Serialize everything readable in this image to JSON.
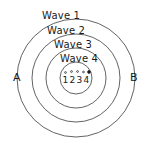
{
  "diagram": {
    "background_color": "#ffffff",
    "stroke_color": "#3b3b3b",
    "text_color": "#1a1a1a",
    "wave_labels": [
      {
        "id": "wave-1",
        "text": "Wave 1"
      },
      {
        "id": "wave-2",
        "text": "Wave 2"
      },
      {
        "id": "wave-3",
        "text": "Wave 3"
      },
      {
        "id": "wave-4",
        "text": "Wave 4"
      }
    ],
    "point_labels": [
      {
        "id": "point-a",
        "text": "A"
      },
      {
        "id": "point-b",
        "text": "B"
      }
    ],
    "center": {
      "numbers": [
        "1",
        "2",
        "3",
        "4"
      ],
      "dots": [
        {
          "index": 1,
          "filled": false
        },
        {
          "index": 2,
          "filled": false
        },
        {
          "index": 3,
          "filled": false
        },
        {
          "index": 4,
          "filled": false
        },
        {
          "index": 5,
          "filled": true
        }
      ]
    },
    "circles": [
      {
        "id": "circle-wave-1",
        "cx": 76,
        "cy": 78,
        "r": 59
      },
      {
        "id": "circle-wave-2",
        "cx": 76,
        "cy": 78,
        "r": 44
      },
      {
        "id": "circle-wave-3",
        "cx": 76,
        "cy": 78,
        "r": 30
      },
      {
        "id": "circle-wave-4",
        "cx": 76,
        "cy": 78,
        "r": 16
      }
    ]
  }
}
